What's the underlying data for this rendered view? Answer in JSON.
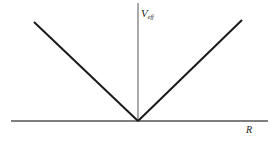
{
  "diagram": {
    "y_axis_label": {
      "main": "V",
      "subscript": "eff"
    },
    "x_axis_label": "R",
    "colors": {
      "axis": "#555555",
      "curve": "#1a1a1a",
      "background": "#ffffff"
    },
    "geometry": {
      "x_axis": {
        "x1": 11,
        "y1": 121,
        "x2": 268,
        "y2": 121
      },
      "y_axis": {
        "x1": 138,
        "y1": 3,
        "x2": 138,
        "y2": 121
      },
      "left_branch": {
        "x1": 34,
        "y1": 22,
        "x2": 138,
        "y2": 121
      },
      "right_branch": {
        "x1": 138,
        "y1": 121,
        "x2": 242,
        "y2": 20
      }
    }
  }
}
